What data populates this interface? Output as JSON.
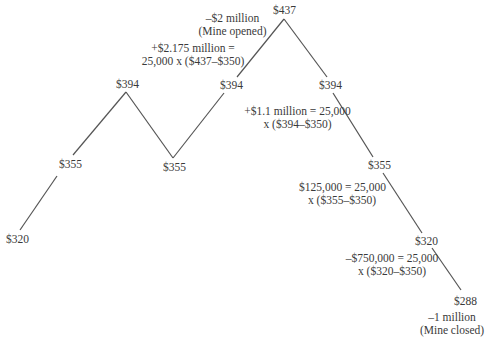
{
  "diagram": {
    "type": "price-path",
    "line_color": "#555555",
    "nodes": [
      {
        "id": "n0",
        "label": "$320",
        "x": 18,
        "y": 231
      },
      {
        "id": "n1",
        "label": "$355",
        "x": 70,
        "y": 163
      },
      {
        "id": "n2",
        "label": "$394",
        "x": 126,
        "y": 91
      },
      {
        "id": "n3",
        "label": "$355",
        "x": 173,
        "y": 158
      },
      {
        "id": "n4",
        "label": "$394",
        "x": 231,
        "y": 85
      },
      {
        "id": "n5",
        "label": "$437",
        "x": 284,
        "y": 19
      },
      {
        "id": "n6",
        "label": "$394",
        "x": 330,
        "y": 85
      },
      {
        "id": "n7",
        "label": "$355",
        "x": 378,
        "y": 165
      },
      {
        "id": "n8",
        "label": "$320",
        "x": 426,
        "y": 240
      },
      {
        "id": "n9",
        "label": "$288",
        "x": 464,
        "y": 290
      }
    ],
    "edges": [
      [
        "n0",
        "n1"
      ],
      [
        "n1",
        "n2"
      ],
      [
        "n2",
        "n3"
      ],
      [
        "n3",
        "n4"
      ],
      [
        "n4",
        "n5"
      ],
      [
        "n5",
        "n6"
      ],
      [
        "n6",
        "n7"
      ],
      [
        "n7",
        "n8"
      ],
      [
        "n8",
        "n9"
      ]
    ],
    "annotations": {
      "mine_opened": {
        "line1": "–$2 million",
        "line2": "(Mine opened)"
      },
      "payoff_437": {
        "line1": "+$2.175 million =",
        "line2": "25,000 x ($437–$350)"
      },
      "payoff_394": {
        "line1": "+$1.1 million = 25,000",
        "line2": "x ($394–$350)"
      },
      "payoff_355": {
        "line1": "$125,000 = 25,000",
        "line2": "x ($355–$350)"
      },
      "payoff_320": {
        "line1": "–$750,000 = 25,000",
        "line2": "x ($320–$350)"
      },
      "mine_closed": {
        "line1": "–1 million",
        "line2": "(Mine closed)"
      }
    }
  }
}
